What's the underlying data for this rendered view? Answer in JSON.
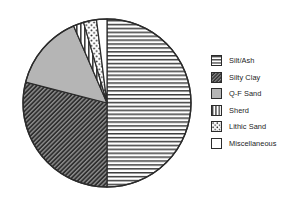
{
  "chart_data": {
    "type": "pie",
    "title": "",
    "xlabel": "",
    "ylabel": "",
    "unit": "percent",
    "legend_position": "right",
    "grid": false,
    "start_angle_deg": 0,
    "direction": "clockwise",
    "categories": [
      "Silt/Ash",
      "Silty Clay",
      "Q-F Sand",
      "Sherd",
      "Lithic Sand",
      "Miscellaneous"
    ],
    "values": [
      50.0,
      29.0,
      14.5,
      2.0,
      2.5,
      2.0
    ],
    "slices": [
      {
        "label": "Silt/Ash",
        "value": 50.0,
        "start_angle_deg": 0,
        "end_angle_deg": 180,
        "pattern": "horizontal-lines",
        "fill": "#ffffff",
        "stroke": "#2b2b2b"
      },
      {
        "label": "Silty Clay",
        "value": 29.0,
        "start_angle_deg": 180,
        "end_angle_deg": 284.4,
        "pattern": "dense-diagonal-hatch",
        "fill": "#3a3a3a",
        "stroke": "#2b2b2b"
      },
      {
        "label": "Q-F Sand",
        "value": 14.5,
        "start_angle_deg": 284.4,
        "end_angle_deg": 336.6,
        "pattern": "solid-gray",
        "fill": "#b5b5b5",
        "stroke": "#2b2b2b"
      },
      {
        "label": "Sherd",
        "value": 2.0,
        "start_angle_deg": 336.6,
        "end_angle_deg": 343.8,
        "pattern": "vertical-lines",
        "fill": "#ffffff",
        "stroke": "#2b2b2b"
      },
      {
        "label": "Lithic Sand",
        "value": 2.5,
        "start_angle_deg": 343.8,
        "end_angle_deg": 352.8,
        "pattern": "stipple-dots",
        "fill": "#ffffff",
        "stroke": "#2b2b2b"
      },
      {
        "label": "Miscellaneous",
        "value": 2.0,
        "start_angle_deg": 352.8,
        "end_angle_deg": 360,
        "pattern": "blank-white",
        "fill": "#ffffff",
        "stroke": "#2b2b2b"
      }
    ]
  },
  "legend": {
    "items": [
      {
        "label": "Silt/Ash",
        "pattern": "horizontal-lines",
        "swatch_name": "legend-swatch-silt-ash"
      },
      {
        "label": "Silty Clay",
        "pattern": "dense-diagonal-hatch",
        "swatch_name": "legend-swatch-silty-clay"
      },
      {
        "label": "Q-F Sand",
        "pattern": "solid-gray",
        "swatch_name": "legend-swatch-qf-sand"
      },
      {
        "label": "Sherd",
        "pattern": "vertical-lines",
        "swatch_name": "legend-swatch-sherd"
      },
      {
        "label": "Lithic Sand",
        "pattern": "stipple-dots",
        "swatch_name": "legend-swatch-lithic-sand"
      },
      {
        "label": "Miscellaneous",
        "pattern": "blank-white",
        "swatch_name": "legend-swatch-miscellaneous"
      }
    ]
  },
  "colors": {
    "outline": "#2b2b2b",
    "silty_clay_fill": "#3a3a3a",
    "qf_sand_fill": "#b5b5b5",
    "background": "#ffffff",
    "text": "#1c1c1c"
  },
  "title_sliver": {
    "text": ""
  }
}
